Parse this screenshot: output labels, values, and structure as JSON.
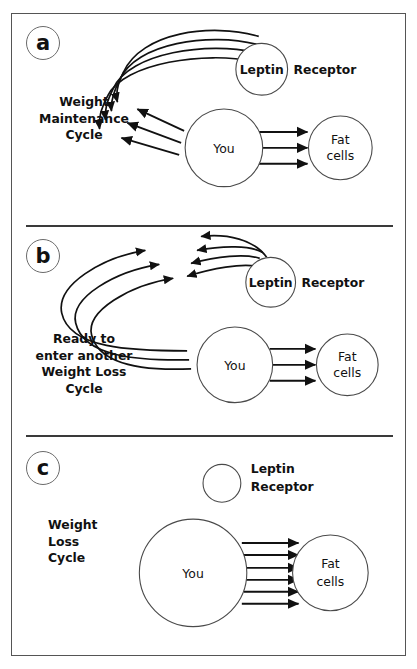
{
  "figure": {
    "panels": [
      {
        "letter": "a",
        "caption_lines": [
          "Weight",
          "Maintenance",
          "Cycle"
        ],
        "caption": "Weight\nMaintenance\nCycle",
        "nodes": {
          "you": "You",
          "leptin": "Leptin",
          "receptor": "Receptor",
          "fat_cells_line1": "Fat",
          "fat_cells_line2": "cells"
        },
        "arrow_counts": {
          "leptin_to_you_arcs": 4,
          "you_to_leptin": 3,
          "you_to_fat_cells": 3
        }
      },
      {
        "letter": "b",
        "caption_lines": [
          "Ready to",
          "enter another",
          "Weight Loss",
          "Cycle"
        ],
        "caption": "Ready to\nenter another\nWeight Loss\nCycle",
        "nodes": {
          "you": "You",
          "leptin": "Leptin",
          "receptor": "Receptor",
          "fat_cells_line1": "Fat",
          "fat_cells_line2": "cells"
        },
        "arrow_counts": {
          "you_to_upper_left_arcs": 3,
          "leptin_outward_arcs": 4,
          "you_to_fat_cells": 3
        }
      },
      {
        "letter": "c",
        "caption_lines": [
          "Weight",
          "Loss",
          "Cycle"
        ],
        "caption": "Weight\nLoss\nCycle",
        "nodes": {
          "you": "You",
          "receptor_line1": "Leptin",
          "receptor_line2": "Receptor",
          "fat_cells_line1": "Fat",
          "fat_cells_line2": "cells"
        },
        "arrow_counts": {
          "you_to_fat_cells": 6,
          "leptin_arrows": 0
        }
      }
    ],
    "colors": {
      "background": "#ffffff",
      "border": "#555555",
      "divider": "#3a3a3a",
      "stroke": "#4a4a4a",
      "arrow": "#111111",
      "text": "#111111"
    }
  }
}
